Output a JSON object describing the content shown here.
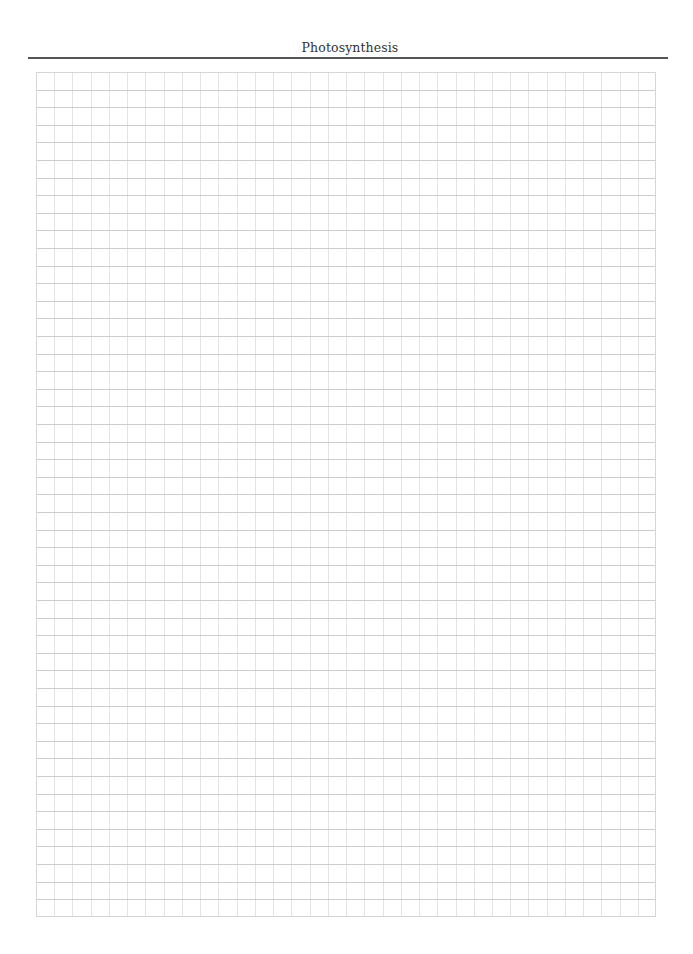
{
  "page": {
    "title": "Photosynthesis"
  },
  "grid": {
    "columns": 34,
    "rows": 48,
    "line_color_horizontal": "#cdcdcd",
    "line_color_vertical": "#e3e3e3",
    "border_color": "#d6d6d6"
  },
  "colors": {
    "background": "#ffffff",
    "title_text": "#333333",
    "header_rule": "#555555"
  }
}
